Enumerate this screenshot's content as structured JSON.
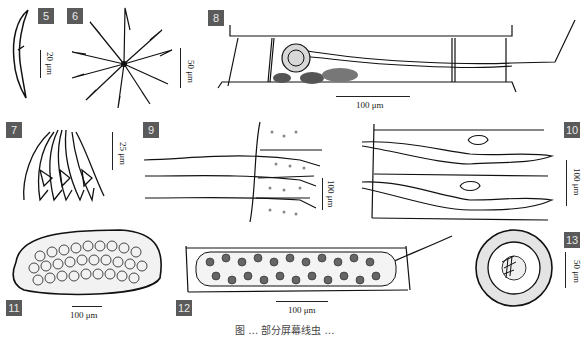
{
  "figure": {
    "caption": "图 … 部分屏幕线虫 …",
    "panels": [
      {
        "id": "5",
        "label": "5",
        "scale": "20 μm",
        "content": "single curved hooked spine"
      },
      {
        "id": "6",
        "label": "6",
        "scale": "50 μm",
        "content": "radial cluster of barbed spines"
      },
      {
        "id": "7",
        "label": "7",
        "scale": "25 μm",
        "content": "bundle of hooked spines"
      },
      {
        "id": "8",
        "label": "8",
        "scale": "100 μm",
        "content": "elongated cell segment with coiled internal body and tail filament"
      },
      {
        "id": "9",
        "label": "9",
        "scale": "100 μm",
        "content": "three long bristles emerging from granular segments"
      },
      {
        "id": "10",
        "label": "10",
        "scale": "100 μm",
        "content": "two elongated spindle-shaped bodies within segments"
      },
      {
        "id": "11",
        "label": "11",
        "scale": "100 μm",
        "content": "oval body filled with round cells"
      },
      {
        "id": "12",
        "label": "12",
        "scale": "100 μm",
        "content": "rectangular segment filled with polygonal cells and filament"
      },
      {
        "id": "13",
        "label": "13",
        "scale": "50 μm",
        "content": "concentric circular cyst with spiny core"
      }
    ]
  }
}
